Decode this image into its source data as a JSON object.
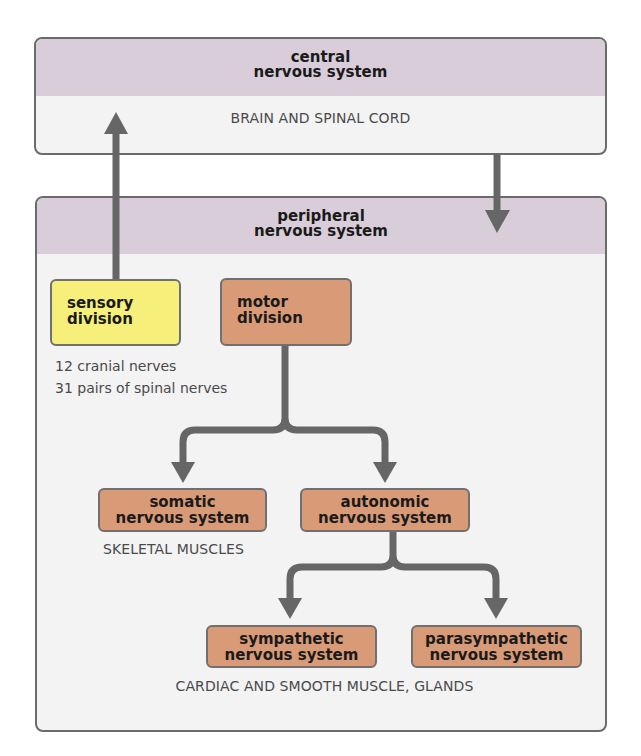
{
  "central": {
    "title_line1": "central",
    "title_line2": "nervous system",
    "description": "BRAIN AND SPINAL CORD"
  },
  "peripheral": {
    "title_line1": "peripheral",
    "title_line2": "nervous system"
  },
  "sensory": {
    "line1": "sensory",
    "line2": "division",
    "note_line1": "12 cranial nerves",
    "note_line2": "31 pairs of spinal nerves"
  },
  "motor": {
    "line1": "motor",
    "line2": "division"
  },
  "somatic": {
    "line1": "somatic",
    "line2": "nervous system",
    "target": "SKELETAL MUSCLES"
  },
  "autonomic": {
    "line1": "autonomic",
    "line2": "nervous system"
  },
  "sympathetic": {
    "line1": "sympathetic",
    "line2": "nervous system"
  },
  "parasympathetic": {
    "line1": "parasympathetic",
    "line2": "nervous system"
  },
  "autonomic_targets": "CARDIAC AND SMOOTH MUSCLE, GLANDS",
  "colors": {
    "header": "#d8cdd9",
    "panel": "#f3f3f4",
    "sensory": "#f6f07a",
    "motor": "#d99a78",
    "arrow": "#666666"
  }
}
